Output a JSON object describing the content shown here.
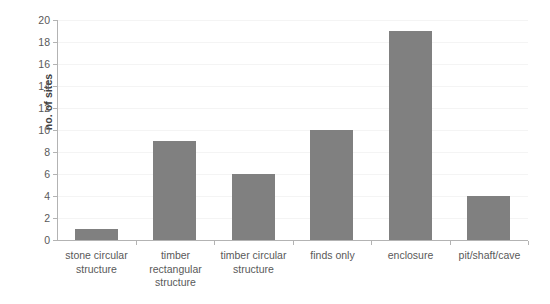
{
  "chart_data": {
    "type": "bar",
    "title": "",
    "xlabel": "",
    "ylabel": "no. of sites",
    "ylim": [
      0,
      20
    ],
    "ytick_step": 2,
    "yticks": [
      0,
      2,
      4,
      6,
      8,
      10,
      12,
      14,
      16,
      18,
      20
    ],
    "grid": true,
    "legend": false,
    "bar_color": "#808080",
    "axis_color": "#b3b3b3",
    "gridline_color": "#f4f4f4",
    "text_color": "#595959",
    "categories": [
      "stone circular structure",
      "timber rectangular structure",
      "timber circular structure",
      "finds only",
      "enclosure",
      "pit/shaft/cave"
    ],
    "category_labels_wrapped": [
      "stone circular\nstructure",
      "timber\nrectangular\nstructure",
      "timber circular\nstructure",
      "finds only",
      "enclosure",
      "pit/shaft/cave"
    ],
    "values": [
      1,
      9,
      6,
      10,
      19,
      4
    ]
  }
}
